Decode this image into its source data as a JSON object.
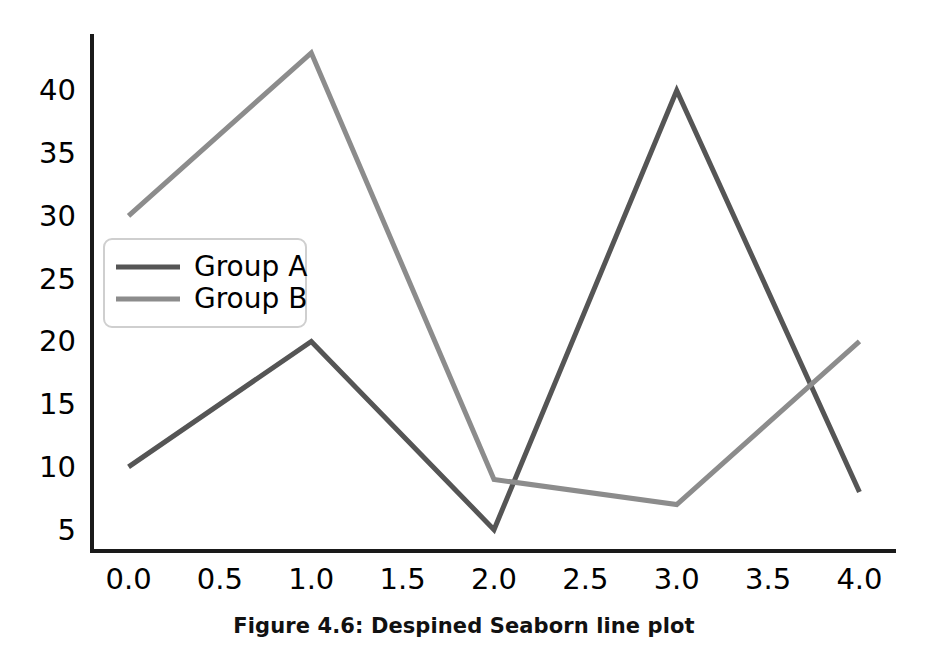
{
  "figure": {
    "caption": "Figure 4.6: Despined Seaborn line plot",
    "background_color": "#ffffff",
    "spine_color": "#1a1a1a"
  },
  "chart_data": {
    "type": "line",
    "title": "",
    "subtitle": "",
    "xlabel": "",
    "ylabel": "",
    "x": [
      0,
      1,
      2,
      3,
      4
    ],
    "series": [
      {
        "name": "Group A",
        "values": [
          10,
          20,
          5,
          40,
          8
        ],
        "color": "#555555"
      },
      {
        "name": "Group B",
        "values": [
          30,
          43,
          9,
          7,
          20
        ],
        "color": "#8c8c8c"
      }
    ],
    "xlim": [
      -0.2,
      4.2
    ],
    "ylim": [
      3.3,
      44.5
    ],
    "xticks": [
      0.0,
      0.5,
      1.0,
      1.5,
      2.0,
      2.5,
      3.0,
      3.5,
      4.0
    ],
    "xtick_labels": [
      "0.0",
      "0.5",
      "1.0",
      "1.5",
      "2.0",
      "2.5",
      "3.0",
      "3.5",
      "4.0"
    ],
    "yticks": [
      5,
      10,
      15,
      20,
      25,
      30,
      35,
      40
    ],
    "ytick_labels": [
      "5",
      "10",
      "15",
      "20",
      "25",
      "30",
      "35",
      "40"
    ],
    "grid": false,
    "legend_position": "upper left",
    "spines_visible": [
      "left",
      "bottom"
    ]
  }
}
